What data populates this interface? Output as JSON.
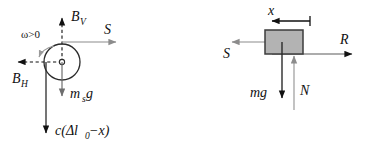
{
  "figure": {
    "colors": {
      "ink": "#111111",
      "gray_arrow": "#8c8c8c",
      "block_fill": "#b3b3b3",
      "block_stroke": "#3c3c3c",
      "background": "#ffffff"
    },
    "left_diagram": {
      "name": "rotating-disc-free-body",
      "body_shape": "circle",
      "labels": {
        "omega": "ω>0",
        "b_vertical_base": "B",
        "b_vertical_sub": "V",
        "b_horizontal_base": "B",
        "b_horizontal_sub": "H",
        "s_force": "S",
        "weight_base": "m",
        "weight_sub": "s",
        "weight_tail": "g",
        "spring_force": "c(Δl",
        "spring_sub": "0",
        "spring_tail": "−x)"
      },
      "forces": [
        {
          "name": "B_V",
          "direction": "up",
          "style": "dashed",
          "color": "#111111"
        },
        {
          "name": "B_H",
          "direction": "left",
          "style": "dashed",
          "color": "#111111"
        },
        {
          "name": "S",
          "direction": "right",
          "style": "solid",
          "color": "#8c8c8c"
        },
        {
          "name": "m_s g",
          "direction": "down",
          "style": "solid",
          "color": "#6e6e6e"
        },
        {
          "name": "c(Δl_0−x)",
          "direction": "down",
          "style": "solid",
          "color": "#111111"
        },
        {
          "name": "ω>0",
          "direction": "curved-counterclockwise",
          "style": "solid",
          "color": "#8c8c8c"
        }
      ]
    },
    "right_diagram": {
      "name": "sliding-block-free-body",
      "body_shape": "rectangle",
      "labels": {
        "displacement": "x",
        "s_force": "S",
        "r_force": "R",
        "weight": "mg",
        "normal": "N"
      },
      "forces": [
        {
          "name": "x",
          "direction": "left",
          "style": "dimension",
          "color": "#111111"
        },
        {
          "name": "S",
          "direction": "left",
          "style": "solid",
          "color": "#8c8c8c"
        },
        {
          "name": "R",
          "direction": "right",
          "style": "solid",
          "color": "#111111"
        },
        {
          "name": "mg",
          "direction": "down",
          "style": "solid",
          "color": "#111111"
        },
        {
          "name": "N",
          "direction": "up",
          "style": "solid",
          "color": "#8c8c8c"
        }
      ]
    }
  }
}
